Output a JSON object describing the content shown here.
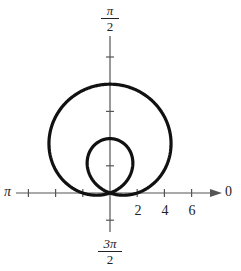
{
  "chart_data": {
    "type": "polar",
    "curve": "r = 2 + 6 sin(theta)",
    "outer_loop_max_r": 8,
    "inner_loop_max_r": 4,
    "x_axis_crossings": [
      -2,
      2
    ],
    "angle_labels": {
      "top": {
        "num": "π",
        "den": "2"
      },
      "bottom": {
        "num": "3π",
        "den": "2"
      },
      "left": "π",
      "right": "0"
    },
    "radial_tick_labels": [
      "2",
      "4",
      "6"
    ],
    "radial_tick_values": [
      2,
      4,
      6
    ],
    "radial_ticks_spacing": 2,
    "axis_range": [
      -8,
      8
    ],
    "grid": false
  },
  "style": {
    "curve_color": "#111111",
    "axis_color": "#555555"
  }
}
